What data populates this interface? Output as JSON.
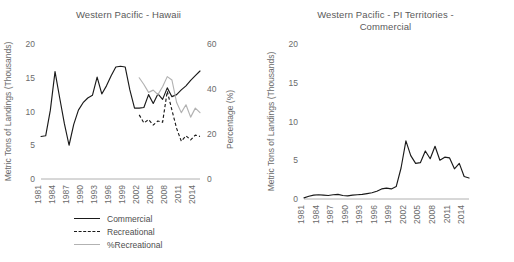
{
  "chart_data": [
    {
      "panel": "left",
      "type": "line",
      "title": "Western Pacific - Hawaii",
      "xlabel": "",
      "ylabel": "Metric Tons of Landings (Thousands)",
      "y2label": "Percentage (%)",
      "ylim": [
        0,
        20
      ],
      "y2lim": [
        0,
        60
      ],
      "yticks": [
        0,
        5,
        10,
        15,
        20
      ],
      "y2ticks": [
        0,
        20,
        40,
        60
      ],
      "xlim": [
        1981,
        2015
      ],
      "xticks": [
        1981,
        1984,
        1987,
        1990,
        1993,
        1996,
        1999,
        2002,
        2005,
        2008,
        2011,
        2014
      ],
      "xticklabels": [
        "1981",
        "1984",
        "1987",
        "1990",
        "1993",
        "1996",
        "1999",
        "2002",
        "2005",
        "2008",
        "2011",
        "2014"
      ],
      "grid": false,
      "legend_position": "below",
      "x": [
        1981,
        1982,
        1983,
        1984,
        1985,
        1986,
        1987,
        1988,
        1989,
        1990,
        1991,
        1992,
        1993,
        1994,
        1995,
        1996,
        1997,
        1998,
        1999,
        2000,
        2001,
        2002,
        2003,
        2004,
        2005,
        2006,
        2007,
        2008,
        2009,
        2010,
        2011,
        2012,
        2013,
        2014,
        2015
      ],
      "series": [
        {
          "name": "Commercial",
          "axis": "left",
          "style": "solid-black",
          "values": [
            6.3,
            6.4,
            10.2,
            15.9,
            12.0,
            8.2,
            5.0,
            8.1,
            10.2,
            11.3,
            12.0,
            12.4,
            15.1,
            12.6,
            13.8,
            15.3,
            16.6,
            16.7,
            16.6,
            13.2,
            10.5,
            10.5,
            10.6,
            12.5,
            11.2,
            12.6,
            11.8,
            13.5,
            12.2,
            12.5,
            13.2,
            13.8,
            14.6,
            15.3,
            16.0
          ]
        },
        {
          "name": "Recreational",
          "axis": "left",
          "style": "dashed-black",
          "values": [
            null,
            null,
            null,
            null,
            null,
            null,
            null,
            null,
            null,
            null,
            null,
            null,
            null,
            null,
            null,
            null,
            null,
            null,
            null,
            null,
            null,
            9.5,
            8.3,
            8.8,
            8.0,
            8.6,
            8.4,
            13.0,
            10.2,
            7.5,
            5.6,
            6.4,
            5.8,
            6.5,
            6.3
          ]
        },
        {
          "name": "%Recreational",
          "axis": "right",
          "style": "solid-gray",
          "values": [
            null,
            null,
            null,
            null,
            null,
            null,
            null,
            null,
            null,
            null,
            null,
            null,
            null,
            null,
            null,
            null,
            null,
            null,
            null,
            null,
            null,
            45.0,
            42.0,
            38.5,
            39.5,
            37.5,
            41.0,
            45.5,
            44.0,
            34.0,
            29.5,
            33.0,
            27.5,
            31.5,
            29.5
          ]
        }
      ],
      "legend": [
        {
          "label": "Commercial",
          "style": "solid-black"
        },
        {
          "label": "Recreational",
          "style": "dashed-black"
        },
        {
          "label": "%Recreational",
          "style": "solid-gray"
        }
      ]
    },
    {
      "panel": "right",
      "type": "line",
      "title_lines": [
        "Western Pacific - PI Territories -",
        "Commercial"
      ],
      "title": "Western Pacific - PI Territories - Commercial",
      "xlabel": "",
      "ylabel": "Metric Tons of Landings (Thousands)",
      "ylim": [
        0,
        20
      ],
      "yticks": [
        0,
        5,
        10,
        15,
        20
      ],
      "xlim": [
        1981,
        2015
      ],
      "xticks": [
        1981,
        1984,
        1987,
        1990,
        1993,
        1996,
        1999,
        2002,
        2005,
        2008,
        2011,
        2014
      ],
      "xticklabels": [
        "1981",
        "1984",
        "1987",
        "1990",
        "1993",
        "1996",
        "1999",
        "2002",
        "2005",
        "2008",
        "2011",
        "2014"
      ],
      "grid": false,
      "legend_position": "none",
      "x": [
        1981,
        1982,
        1983,
        1984,
        1985,
        1986,
        1987,
        1988,
        1989,
        1990,
        1991,
        1992,
        1993,
        1994,
        1995,
        1996,
        1997,
        1998,
        1999,
        2000,
        2001,
        2002,
        2003,
        2004,
        2005,
        2006,
        2007,
        2008,
        2009,
        2010,
        2011,
        2012,
        2013,
        2014,
        2015
      ],
      "series": [
        {
          "name": "Commercial",
          "axis": "left",
          "style": "solid-black",
          "values": [
            0.15,
            0.35,
            0.5,
            0.55,
            0.5,
            0.45,
            0.55,
            0.6,
            0.45,
            0.4,
            0.5,
            0.55,
            0.6,
            0.7,
            0.8,
            1.0,
            1.3,
            1.4,
            1.3,
            1.6,
            4.0,
            7.5,
            5.6,
            4.6,
            4.7,
            6.2,
            5.2,
            6.8,
            5.0,
            5.4,
            5.3,
            3.9,
            4.6,
            2.9,
            2.7
          ]
        }
      ]
    }
  ],
  "colors": {
    "commercial": "#1a1a1a",
    "recreational": "#1a1a1a",
    "pct_recreational": "#b2b2b2",
    "axis": "#b0b0b0",
    "text": "#6b6b6b",
    "background": "#ffffff"
  }
}
